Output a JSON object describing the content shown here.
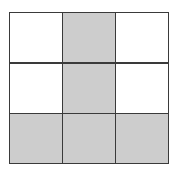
{
  "grid": {
    "rows": 3,
    "cols": 3,
    "line_color": "#3a3a3a",
    "fill_color": "#cdcdcd",
    "empty_color": "#ffffff",
    "cells": [
      [
        false,
        true,
        false
      ],
      [
        false,
        true,
        false
      ],
      [
        true,
        true,
        true
      ]
    ]
  }
}
